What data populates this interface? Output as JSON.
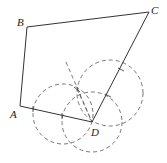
{
  "figure": {
    "type": "geometry-construction",
    "points": {
      "A": {
        "label": "A",
        "x": 20,
        "y": 106
      },
      "B": {
        "label": "B",
        "x": 27,
        "y": 27
      },
      "C": {
        "label": "C",
        "x": 149,
        "y": 12
      },
      "D": {
        "label": "D",
        "x": 92,
        "y": 122
      }
    },
    "segments": [
      [
        "A",
        "B"
      ],
      [
        "B",
        "C"
      ],
      [
        "C",
        "D"
      ],
      [
        "D",
        "A"
      ]
    ],
    "construction_circles": [
      {
        "cx": 63,
        "cy": 114,
        "r": 30
      },
      {
        "cx": 92,
        "cy": 122,
        "r": 30
      },
      {
        "cx": 110,
        "cy": 93,
        "r": 33
      }
    ],
    "construction_lines": [
      {
        "x1": 66,
        "y1": 62,
        "x2": 92,
        "y2": 122
      }
    ],
    "colors": {
      "stroke": "#333333",
      "dashed": "#555555"
    }
  }
}
